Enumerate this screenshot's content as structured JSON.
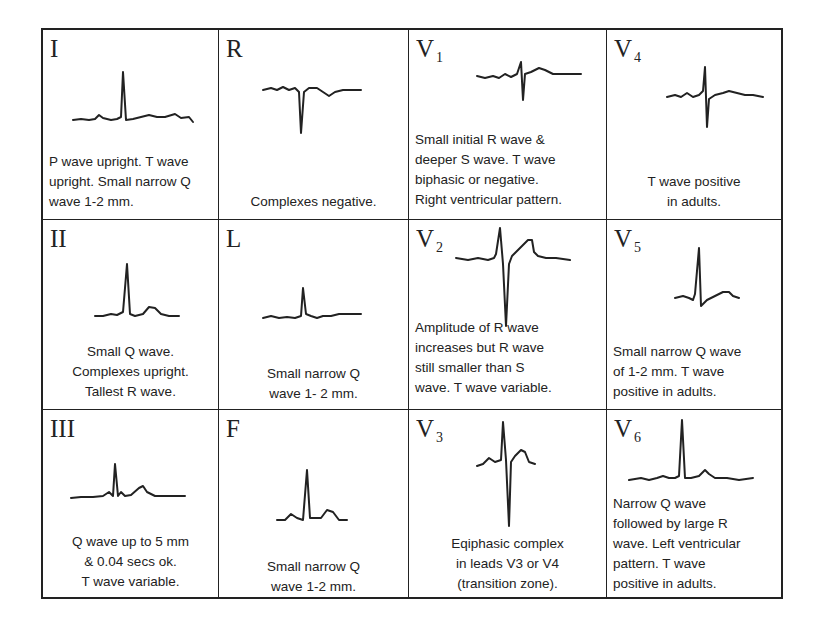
{
  "grid": {
    "rows": 3,
    "columns": 4
  },
  "cells": {
    "I": {
      "lead": "I",
      "sub": "",
      "description": "P wave upright. T wave upright. Small narrow Q wave 1-2 mm."
    },
    "R": {
      "lead": "R",
      "sub": "",
      "description": "Complexes negative."
    },
    "V1": {
      "lead": "V",
      "sub": "1",
      "description": "Small initial R wave & deeper S wave. T wave biphasic or negative. Right ventricular pattern."
    },
    "V4": {
      "lead": "V",
      "sub": "4",
      "description": "T wave positive in adults."
    },
    "II": {
      "lead": "II",
      "sub": "",
      "description": "Small Q wave. Complexes upright. Tallest R wave."
    },
    "L": {
      "lead": "L",
      "sub": "",
      "description": "Small narrow Q wave 1- 2 mm."
    },
    "V2": {
      "lead": "V",
      "sub": "2",
      "description": "Amplitude of R wave increases but R wave still smaller than S wave. T wave variable."
    },
    "V5": {
      "lead": "V",
      "sub": "5",
      "description": "Small narrow Q wave of 1-2 mm. T wave positive in adults."
    },
    "III": {
      "lead": "III",
      "sub": "",
      "description": "Q wave up to 5 mm & 0.04 secs ok. T wave variable."
    },
    "F": {
      "lead": "F",
      "sub": "",
      "description": "Small narrow Q wave 1-2 mm."
    },
    "V3": {
      "lead": "V",
      "sub": "3",
      "description": "Eqiphasic complex in leads V3 or V4 (transition zone)."
    },
    "V6": {
      "lead": "V",
      "sub": "6",
      "description": "Narrow Q wave followed by large R wave. Left ventricular pattern. T wave positive in adults."
    }
  },
  "descriptions_lines": {
    "I": [
      "P wave upright. T wave",
      "upright. Small narrow Q",
      "wave 1-2 mm."
    ],
    "R": [
      "Complexes negative."
    ],
    "V1": [
      "Small initial R wave &",
      "deeper S wave. T wave",
      "biphasic or negative.",
      "Right ventricular pattern."
    ],
    "V4": [
      "T wave positive",
      "in adults."
    ],
    "II": [
      "Small Q wave.",
      "Complexes upright.",
      "Tallest R wave."
    ],
    "L": [
      "Small narrow Q",
      "wave 1- 2 mm."
    ],
    "V2": [
      "Amplitude of R wave",
      "increases but R wave",
      "still smaller than S",
      "wave. T wave variable."
    ],
    "V5": [
      "Small narrow Q wave",
      "of 1-2 mm. T wave",
      "positive in adults."
    ],
    "III": [
      "Q wave up to 5 mm",
      "& 0.04 secs ok.",
      "T wave variable."
    ],
    "F": [
      "Small narrow Q",
      "wave 1-2 mm."
    ],
    "V3": [
      "Eqiphasic complex",
      "in leads V3 or V4",
      "(transition zone)."
    ],
    "V6": [
      "Narrow Q wave",
      "followed by large R",
      "wave. Left ventricular",
      "pattern. T wave",
      "positive in adults."
    ]
  },
  "colors": {
    "ink": "#222222",
    "background": "#ffffff"
  }
}
